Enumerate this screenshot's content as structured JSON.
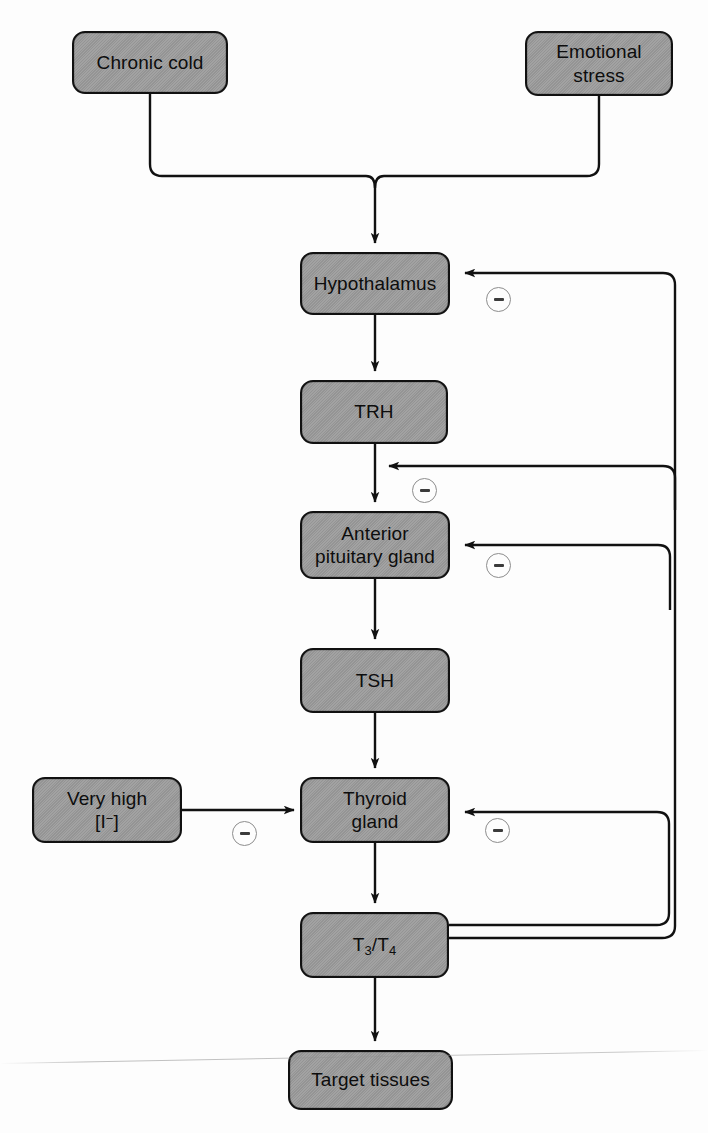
{
  "diagram": {
    "stroke_color": "#111111",
    "node_fill": "#9b9b9b",
    "minus_circle_color": "#8d8d8d"
  },
  "nodes": {
    "chronic_cold": {
      "label": "Chronic cold"
    },
    "emotional_stress": {
      "line1": "Emotional",
      "line2": "stress"
    },
    "hypothalamus": {
      "label": "Hypothalamus"
    },
    "trh": {
      "label": "TRH"
    },
    "anterior_pituitary": {
      "line1": "Anterior",
      "line2": "pituitary gland"
    },
    "tsh": {
      "label": "TSH"
    },
    "very_high_iodide": {
      "line1": "Very high",
      "line2_pre": "[I",
      "line2_sup": "−",
      "line2_post": "]"
    },
    "thyroid_gland": {
      "line1": "Thyroid",
      "line2": "gland"
    },
    "t3_t4": {
      "pre": "T",
      "sub1": "3",
      "mid": "/T",
      "sub2": "4"
    },
    "target_tissues": {
      "label": "Target tissues"
    }
  },
  "edges": [
    {
      "name": "chronic-cold-to-hypothalamus",
      "from": "chronic_cold",
      "to": "hypothalamus",
      "sign": "stimulatory"
    },
    {
      "name": "emotional-stress-to-hypothalamus",
      "from": "emotional_stress",
      "to": "hypothalamus",
      "sign": "stimulatory"
    },
    {
      "name": "hypothalamus-to-trh",
      "from": "hypothalamus",
      "to": "trh",
      "sign": "stimulatory"
    },
    {
      "name": "trh-to-anterior-pituitary",
      "from": "trh",
      "to": "anterior_pituitary",
      "sign": "stimulatory"
    },
    {
      "name": "anterior-pituitary-to-tsh",
      "from": "anterior_pituitary",
      "to": "tsh",
      "sign": "stimulatory"
    },
    {
      "name": "tsh-to-thyroid-gland",
      "from": "tsh",
      "to": "thyroid_gland",
      "sign": "stimulatory"
    },
    {
      "name": "thyroid-gland-to-t3-t4",
      "from": "thyroid_gland",
      "to": "t3_t4",
      "sign": "stimulatory"
    },
    {
      "name": "t3-t4-to-target-tissues",
      "from": "t3_t4",
      "to": "target_tissues",
      "sign": "stimulatory"
    },
    {
      "name": "iodide-inhibits-thyroid",
      "from": "very_high_iodide",
      "to": "thyroid_gland",
      "sign": "inhibitory"
    },
    {
      "name": "t3-t4-inhibits-hypothalamus",
      "from": "t3_t4",
      "to": "hypothalamus",
      "sign": "inhibitory"
    },
    {
      "name": "t3-t4-inhibits-trh-pathway",
      "from": "t3_t4",
      "to": "trh_to_pituitary",
      "sign": "inhibitory"
    },
    {
      "name": "t3-t4-inhibits-anterior-pituitary",
      "from": "t3_t4",
      "to": "anterior_pituitary",
      "sign": "inhibitory"
    },
    {
      "name": "t3-t4-inhibits-thyroid-gland",
      "from": "t3_t4",
      "to": "thyroid_gland",
      "sign": "inhibitory"
    }
  ],
  "minus_markers": [
    {
      "name": "minus-hypothalamus",
      "symbol": "−"
    },
    {
      "name": "minus-trh-pathway",
      "symbol": "−"
    },
    {
      "name": "minus-anterior-pituitary",
      "symbol": "−"
    },
    {
      "name": "minus-iodide",
      "symbol": "−"
    },
    {
      "name": "minus-thyroid-gland",
      "symbol": "−"
    }
  ]
}
